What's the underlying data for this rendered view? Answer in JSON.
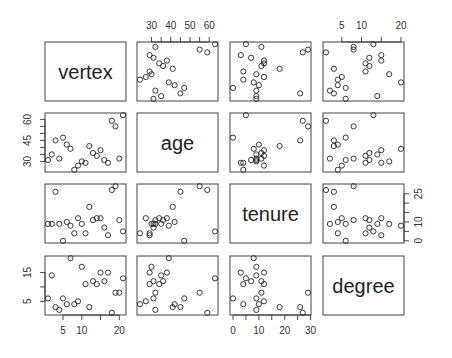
{
  "chart_data": {
    "type": "scatter",
    "subtype": "pairs-matrix",
    "title": "",
    "variables": [
      "vertex",
      "age",
      "tenure",
      "degree"
    ],
    "data": {
      "vertex": [
        1,
        2,
        3,
        4,
        5,
        6,
        7,
        8,
        9,
        10,
        11,
        12,
        13,
        14,
        15,
        16,
        17,
        18,
        19,
        20,
        21
      ],
      "age": [
        31,
        35,
        45,
        32,
        47,
        42,
        39,
        24,
        27,
        30,
        29,
        41,
        36,
        34,
        38,
        31,
        29,
        59,
        55,
        32,
        63
      ],
      "tenure": [
        9,
        9,
        26,
        9,
        0,
        10,
        8,
        4,
        12,
        9,
        4,
        18,
        11,
        12,
        12,
        7,
        3,
        27,
        29,
        11,
        5
      ],
      "degree": [
        6,
        14,
        3,
        2,
        6,
        4,
        20,
        4,
        5,
        17,
        11,
        3,
        12,
        11,
        15,
        12,
        15,
        1,
        8,
        8,
        13
      ]
    },
    "ranges": {
      "vertex": [
        1,
        21
      ],
      "age": [
        24,
        63
      ],
      "tenure": [
        0,
        29
      ],
      "degree": [
        1,
        20
      ]
    },
    "axes": {
      "vertex": {
        "ticks": [
          5,
          10,
          15,
          20
        ],
        "labels": [
          "5",
          "10",
          "",
          "20"
        ],
        "side": "bottom"
      },
      "age": {
        "ticks": [
          30,
          35,
          40,
          45,
          50,
          55,
          60
        ],
        "labels": [
          "30",
          "",
          "40",
          "",
          "50",
          "",
          "60"
        ],
        "side": "top",
        "left_ticks": [
          30,
          35,
          40,
          45,
          50,
          55,
          60
        ],
        "left_labels": [
          "30",
          "",
          "",
          "45",
          "",
          "",
          "60"
        ]
      },
      "tenure": {
        "ticks": [
          0,
          5,
          10,
          15,
          20,
          25,
          30
        ],
        "labels": [
          "0",
          "",
          "10",
          "",
          "20",
          "",
          "30"
        ],
        "side": "bottom",
        "right_ticks": [
          0,
          5,
          10,
          15,
          20,
          25
        ],
        "right_labels": [
          "0",
          "",
          "10",
          "",
          "",
          "25"
        ]
      },
      "degree": {
        "ticks": [
          5,
          10,
          15,
          20
        ],
        "labels": [
          "5",
          "10",
          "",
          "20"
        ],
        "side": "top",
        "left_ticks": [
          5,
          10,
          15
        ],
        "left_labels": [
          "5",
          "",
          "15"
        ],
        "right_ticks": [
          5,
          10,
          15
        ],
        "right_labels": [
          "5",
          "",
          "15"
        ]
      }
    },
    "grid": false,
    "legend": null
  },
  "layout": {
    "col_x": [
      45,
      137,
      230,
      323
    ],
    "row_y": [
      42,
      113,
      184,
      256
    ],
    "panel_w": 81,
    "panel_h": 59,
    "pad": 0.04
  }
}
